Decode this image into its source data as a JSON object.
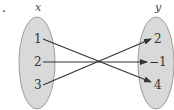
{
  "diagram": {
    "type": "function-mapping",
    "colors": {
      "set_fill": "#d9d9d9",
      "set_stroke": "#888888",
      "arrow": "#333333",
      "text": "#333333"
    },
    "domain_set": {
      "label": "x",
      "elements": [
        "1",
        "2",
        "3"
      ]
    },
    "codomain_set": {
      "label": "y",
      "elements": [
        "2",
        "−1",
        "4"
      ]
    },
    "mappings": [
      {
        "from": "1",
        "to": "4"
      },
      {
        "from": "2",
        "to": "−1"
      },
      {
        "from": "3",
        "to": "2"
      }
    ],
    "stray_mark": "."
  }
}
